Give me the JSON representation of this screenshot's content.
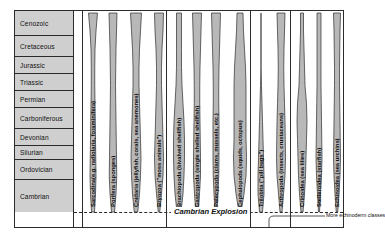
{
  "diagram": {
    "colors": {
      "spindle_fill": "#b8b8b8",
      "era_fill": "#cfcfcf",
      "frame_stroke": "#2b2b2b",
      "background": "#ffffff"
    }
  },
  "eras": [
    {
      "label": "Cenozoic",
      "top": 0,
      "height": 25
    },
    {
      "label": "Cretaceous",
      "top": 25,
      "height": 21
    },
    {
      "label": "Jurassic",
      "top": 46,
      "height": 17
    },
    {
      "label": "Triassic",
      "top": 63,
      "height": 17
    },
    {
      "label": "Permian",
      "top": 80,
      "height": 17
    },
    {
      "label": "Carboniferous",
      "top": 97,
      "height": 21
    },
    {
      "label": "Devonian",
      "top": 118,
      "height": 17
    },
    {
      "label": "Silurian",
      "top": 135,
      "height": 14
    },
    {
      "label": "Ordovician",
      "top": 149,
      "height": 20
    },
    {
      "label": "Cambrian",
      "top": 169,
      "height": 32
    }
  ],
  "taxa": [
    {
      "label": "Sarcodina(e.g. radiolaria, foraminifera)",
      "cx": 19,
      "widths": [
        9,
        6,
        4,
        3.5,
        3.5,
        4,
        4.5,
        5,
        5.5,
        6,
        5,
        3
      ],
      "label_x": 16,
      "label_y": 196
    },
    {
      "label": "Porifera (sponges)",
      "cx": 39,
      "widths": [
        8,
        7,
        6,
        5.5,
        5,
        5.5,
        6,
        6.5,
        7,
        7.5,
        6,
        3
      ],
      "label_x": 36,
      "label_y": 196
    },
    {
      "label": "Cnidaria (jellyfish, corals, sea anemones)",
      "cx": 62,
      "widths": [
        11,
        9,
        7,
        6,
        6,
        7,
        8,
        9,
        10,
        9,
        7,
        3.5
      ],
      "label_x": 59,
      "label_y": 196
    },
    {
      "label": "Bryozoa (\"moss animals\")",
      "cx": 85,
      "widths": [
        9,
        8,
        6,
        5,
        5,
        6,
        7,
        8,
        9,
        8,
        5,
        1.5
      ],
      "label_x": 82,
      "label_y": 196
    },
    {
      "label": "Brachiopoda (bivalved shellfish)",
      "cx": 105,
      "widths": [
        5,
        5,
        5,
        5,
        6,
        8,
        10,
        11,
        11,
        10,
        8,
        4
      ],
      "label_x": 102,
      "label_y": 196
    },
    {
      "label": "Gastropoda (single shelled shellfish)",
      "cx": 123,
      "widths": [
        9,
        8,
        7,
        6,
        5.5,
        5.5,
        6,
        6.5,
        7,
        7,
        5,
        2.5
      ],
      "label_x": 120,
      "label_y": 196
    },
    {
      "label": "Pelecypoda (clams, mussels, etc.)",
      "cx": 142,
      "widths": [
        9,
        8,
        7,
        6,
        5.5,
        5.5,
        6,
        6,
        6,
        5.5,
        4,
        2
      ],
      "label_x": 139,
      "label_y": 196
    },
    {
      "label": "Cephalopoda (squids, octopus)",
      "cx": 166,
      "widths": [
        6,
        7,
        9,
        11,
        12,
        12,
        12,
        12,
        13,
        12,
        8,
        2
      ],
      "label_x": 163,
      "label_y": 196
    },
    {
      "label": "Trilobita (\"pill bugs\")",
      "cx": 187,
      "widths": [
        0,
        0,
        0,
        0,
        1,
        2,
        3,
        4,
        5,
        6,
        6,
        3
      ],
      "label_x": 184,
      "label_y": 196
    },
    {
      "label": "Arthropoda (insects, crustaceans)",
      "cx": 207,
      "widths": [
        8,
        7,
        6,
        5.5,
        6,
        7,
        8,
        8.5,
        9,
        8,
        5,
        2
      ],
      "label_x": 204,
      "label_y": 196
    },
    {
      "label": "Crinoidea (sea lilies)",
      "cx": 228,
      "widths": [
        3,
        3,
        4,
        5,
        6,
        9,
        10,
        9,
        8,
        7,
        5,
        2
      ],
      "label_x": 225,
      "label_y": 196
    },
    {
      "label": "Stelleroidea (starfish)",
      "cx": 245,
      "widths": [
        4,
        4,
        4,
        4,
        4,
        4.5,
        5,
        5.5,
        6,
        5,
        3,
        1
      ],
      "label_x": 242,
      "label_y": 196
    },
    {
      "label": "Echinoidea (sea urchins)",
      "cx": 263,
      "widths": [
        7,
        6,
        5.5,
        5,
        5,
        5.5,
        6,
        6.5,
        7,
        6,
        4,
        1.5
      ],
      "label_x": 260,
      "label_y": 196
    }
  ],
  "annotations": {
    "cambrian_explosion": "Cambrian Explosion",
    "more_echinoderm_classes": "More echinoderm classes"
  },
  "dividers": [
    8,
    92,
    176,
    216
  ]
}
